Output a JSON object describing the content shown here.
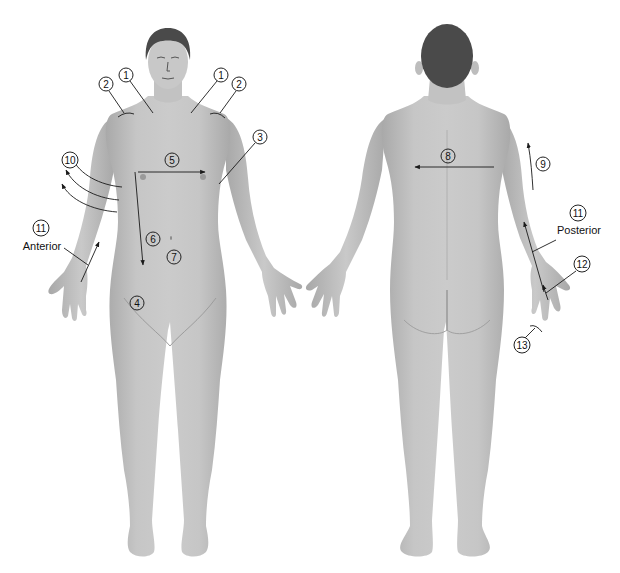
{
  "figure": {
    "colors": {
      "skin": "#bdbdbd",
      "skin_light": "#d2d2d2",
      "skin_dark": "#a3a3a3",
      "hair": "#4a4a4a",
      "line": "#1a1a1a",
      "background": "#ffffff"
    },
    "views": [
      {
        "name": "anterior-view",
        "caption": "Anterior"
      },
      {
        "name": "posterior-view",
        "caption": "Posterior"
      }
    ]
  },
  "labels": [
    {
      "id": "label-1-left",
      "text": "1",
      "x": 126,
      "y": 75,
      "on_body": false
    },
    {
      "id": "label-2-left",
      "text": "2",
      "x": 106,
      "y": 84,
      "on_body": false
    },
    {
      "id": "label-1-right",
      "text": "1",
      "x": 221,
      "y": 75,
      "on_body": false
    },
    {
      "id": "label-2-right",
      "text": "2",
      "x": 239,
      "y": 84,
      "on_body": false
    },
    {
      "id": "label-3",
      "text": "3",
      "x": 260,
      "y": 137,
      "on_body": false
    },
    {
      "id": "label-5",
      "text": "5",
      "x": 172,
      "y": 160,
      "on_body": true
    },
    {
      "id": "label-10",
      "text": "10",
      "x": 70,
      "y": 160,
      "on_body": false,
      "wide": true
    },
    {
      "id": "label-11-ant",
      "text": "11",
      "x": 41,
      "y": 228,
      "on_body": false,
      "wide": true
    },
    {
      "id": "label-6",
      "text": "6",
      "x": 153,
      "y": 239,
      "on_body": true
    },
    {
      "id": "label-7",
      "text": "7",
      "x": 174,
      "y": 257,
      "on_body": true
    },
    {
      "id": "label-4",
      "text": "4",
      "x": 137,
      "y": 303,
      "on_body": true
    },
    {
      "id": "label-8",
      "text": "8",
      "x": 448,
      "y": 156,
      "on_body": true
    },
    {
      "id": "label-9",
      "text": "9",
      "x": 543,
      "y": 164,
      "on_body": false
    },
    {
      "id": "label-11-post",
      "text": "11",
      "x": 578,
      "y": 213,
      "on_body": false,
      "wide": true
    },
    {
      "id": "label-12",
      "text": "12",
      "x": 582,
      "y": 264,
      "on_body": false,
      "wide": true
    },
    {
      "id": "label-13",
      "text": "13",
      "x": 522,
      "y": 345,
      "on_body": false,
      "wide": true
    }
  ],
  "captions": [
    {
      "id": "caption-anterior",
      "text": "Anterior",
      "x": 42,
      "y": 246
    },
    {
      "id": "caption-posterior",
      "text": "Posterior",
      "x": 579,
      "y": 230
    }
  ]
}
